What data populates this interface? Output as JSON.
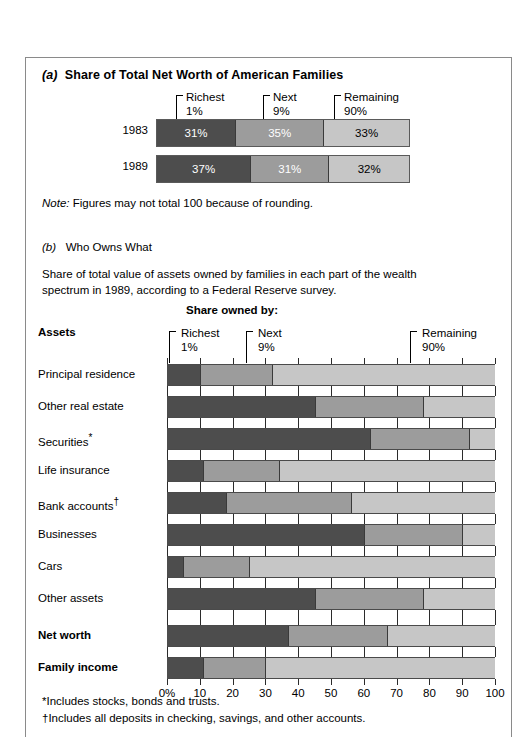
{
  "figure": {
    "section_a": {
      "tag": "(a)",
      "title": "Share of Total Net Worth of American Families",
      "brackets": [
        {
          "line1": "Richest",
          "line2": "1%"
        },
        {
          "line1": "Next",
          "line2": "9%"
        },
        {
          "line1": "Remaining",
          "line2": "90%"
        }
      ],
      "rows": [
        {
          "label": "1983",
          "segments": [
            {
              "value": 31,
              "text": "31%"
            },
            {
              "value": 35,
              "text": "35%"
            },
            {
              "value": 33,
              "text": "33%"
            }
          ]
        },
        {
          "label": "1989",
          "segments": [
            {
              "value": 37,
              "text": "37%"
            },
            {
              "value": 31,
              "text": "31%"
            },
            {
              "value": 32,
              "text": "32%"
            }
          ]
        }
      ],
      "note_prefix": "Note:",
      "note_text": " Figures may not total 100 because of rounding."
    },
    "section_b": {
      "tag": "(b)",
      "title": "Who Owns What",
      "description": "Share of total value of assets owned by families in each part of the wealth spectrum in 1989, according to a Federal Reserve survey.",
      "share_owned_header": "Share owned by:",
      "assets_header": "Assets",
      "brackets": [
        {
          "line1": "Richest",
          "line2": "1%"
        },
        {
          "line1": "Next",
          "line2": "9%"
        },
        {
          "line1": "Remaining",
          "line2": "90%"
        }
      ],
      "axis_ticks": [
        "0%",
        "10",
        "20",
        "30",
        "40",
        "50",
        "60",
        "70",
        "80",
        "90",
        "100"
      ]
    },
    "footnotes": [
      {
        "marker": "*",
        "text": "Includes stocks, bonds and trusts."
      },
      {
        "marker": "†",
        "text": "Includes all deposits in checking, savings, and other accounts."
      }
    ],
    "colors": {
      "richest_1": "#4d4d4d",
      "next_9": "#9c9c9c",
      "remaining_90": "#c6c6c6",
      "frame": "#8a8a8a",
      "text": "#000000"
    }
  },
  "chart_data": [
    {
      "id": "share-of-net-worth",
      "type": "bar",
      "orientation": "horizontal",
      "stacked": true,
      "title": "Share of Total Net Worth of American Families",
      "categories": [
        "1983",
        "1989"
      ],
      "series": [
        {
          "name": "Richest 1%",
          "values": [
            31,
            37
          ],
          "color": "#4d4d4d"
        },
        {
          "name": "Next 9%",
          "values": [
            35,
            31
          ],
          "color": "#9c9c9c"
        },
        {
          "name": "Remaining 90%",
          "values": [
            33,
            32
          ],
          "color": "#c6c6c6"
        }
      ],
      "data_labels": [
        [
          "31%",
          "35%",
          "33%"
        ],
        [
          "37%",
          "31%",
          "32%"
        ]
      ],
      "xlim": [
        0,
        100
      ],
      "xlabel": "",
      "ylabel": "",
      "grid": false,
      "legend_position": "above-bar-brackets",
      "annotation": "Note: Figures may not total 100 because of rounding."
    },
    {
      "id": "who-owns-what",
      "type": "bar",
      "orientation": "horizontal",
      "stacked": true,
      "title": "Who Owns What",
      "subtitle": "Share of total value of assets owned by families in each part of the wealth spectrum in 1989, according to a Federal Reserve survey.",
      "categories": [
        "Principal residence",
        "Other real estate",
        "Securities*",
        "Life insurance",
        "Bank accounts†",
        "Businesses",
        "Cars",
        "Other assets"
      ],
      "series": [
        {
          "name": "Richest 1%",
          "values": [
            10,
            45,
            62,
            11,
            18,
            60,
            5,
            45
          ],
          "color": "#4d4d4d"
        },
        {
          "name": "Next 9%",
          "values": [
            22,
            33,
            30,
            23,
            38,
            30,
            20,
            33
          ],
          "color": "#9c9c9c"
        },
        {
          "name": "Remaining 90%",
          "values": [
            68,
            22,
            8,
            66,
            44,
            10,
            75,
            22
          ],
          "color": "#c6c6c6"
        }
      ],
      "summary_categories": [
        "Net worth",
        "Family income"
      ],
      "summary_series": [
        {
          "name": "Richest 1%",
          "values": [
            37,
            11
          ],
          "color": "#4d4d4d"
        },
        {
          "name": "Next 9%",
          "values": [
            30,
            19
          ],
          "color": "#9c9c9c"
        },
        {
          "name": "Remaining 90%",
          "values": [
            33,
            70
          ],
          "color": "#c6c6c6"
        }
      ],
      "xlim": [
        0,
        100
      ],
      "xticks": [
        0,
        10,
        20,
        30,
        40,
        50,
        60,
        70,
        80,
        90,
        100
      ],
      "xticklabels": [
        "0%",
        "10",
        "20",
        "30",
        "40",
        "50",
        "60",
        "70",
        "80",
        "90",
        "100"
      ],
      "xlabel": "",
      "ylabel": "Assets",
      "grid": false,
      "legend_position": "top-brackets",
      "legend_entries": [
        "Richest 1%",
        "Next 9%",
        "Remaining 90%"
      ]
    }
  ]
}
